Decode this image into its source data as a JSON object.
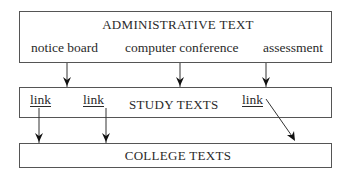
{
  "diagram": {
    "colors": {
      "line": "#333333",
      "border": "#555555",
      "text": "#2a2a2a",
      "background": "#ffffff"
    },
    "boxes": [
      {
        "id": "administrative",
        "title": "ADMINISTRATIVE TEXT",
        "items": [
          "notice board",
          "computer conference",
          "assessment"
        ]
      },
      {
        "id": "study",
        "title": "STUDY TEXTS",
        "links": [
          "link",
          "link",
          "link"
        ]
      },
      {
        "id": "college",
        "title": "COLLEGE TEXTS"
      }
    ],
    "arrows": [
      {
        "from": "notice board",
        "to": "STUDY TEXTS"
      },
      {
        "from": "computer conference",
        "to": "STUDY TEXTS"
      },
      {
        "from": "assessment",
        "to": "STUDY TEXTS"
      },
      {
        "from": "link 1",
        "to": "COLLEGE TEXTS"
      },
      {
        "from": "link 2",
        "to": "COLLEGE TEXTS"
      },
      {
        "from": "link 3",
        "to": "COLLEGE TEXTS"
      }
    ]
  }
}
